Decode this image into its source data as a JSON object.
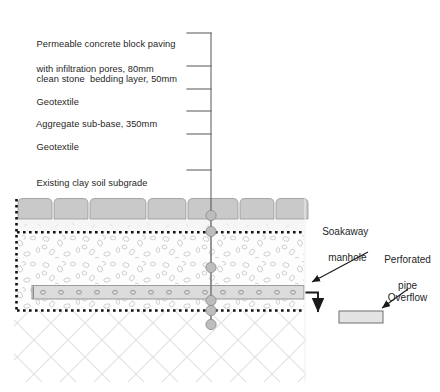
{
  "diagram": {
    "colors": {
      "line": "#555555",
      "leader": "#6b6b6b",
      "block_fill": "#c9c9c9",
      "block_stroke": "#8a8a8a",
      "bedding_fill": "#f4f4f4",
      "aggregate_fill": "#fdfdfd",
      "aggregate_stone": "#b9b9b9",
      "geotextile": "#111111",
      "subgrade_hatch": "#d9d9d9",
      "pipe_fill": "#dcdcdc",
      "pipe_stroke": "#7d7d7d",
      "manhole_fill": "#bdbdbd",
      "manhole_stroke": "#8c8c8c",
      "overflow_fill": "#e3e3e3",
      "text": "#1f1f1f"
    }
  },
  "callouts": {
    "layers": [
      {
        "id": "paving",
        "line1": "Permeable concrete block paving",
        "line2": "with infiltration pores, 80mm"
      },
      {
        "id": "bedding",
        "line1": "clean stone  bedding layer, 50mm",
        "line2": ""
      },
      {
        "id": "geotex-top",
        "line1": "Geotextile",
        "line2": ""
      },
      {
        "id": "subbase",
        "line1": "Aggregate sub-base, 350mm",
        "line2": ""
      },
      {
        "id": "geotex-bot",
        "line1": "Geotextile",
        "line2": ""
      },
      {
        "id": "subgrade",
        "line1": "Existing clay soil subgrade",
        "line2": ""
      }
    ],
    "right": [
      {
        "id": "soakaway",
        "line1": "Soakaway",
        "line2": "manhole"
      },
      {
        "id": "perforated",
        "line1": "Perforated",
        "line2": "pipe"
      },
      {
        "id": "overflow",
        "line1": "Overflow",
        "line2": ""
      }
    ]
  }
}
